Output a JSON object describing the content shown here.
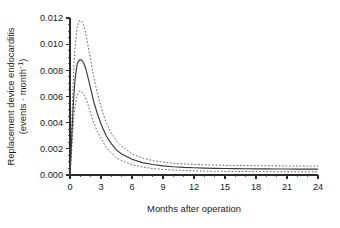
{
  "chart_data": {
    "type": "line",
    "title": "",
    "xlabel": "Months after operation",
    "ylabel_line1": "Replacement device endocarditis",
    "ylabel_line2_pre": "(events · month",
    "ylabel_line2_sup": "−1",
    "ylabel_line2_post": ")",
    "xlim": [
      0,
      24
    ],
    "ylim": [
      0,
      0.012
    ],
    "xticks": [
      0,
      3,
      6,
      9,
      12,
      15,
      18,
      21,
      24
    ],
    "xtick_labels": [
      "0",
      "3",
      "6",
      "9",
      "12",
      "15",
      "18",
      "21",
      "24"
    ],
    "x_minor_step": 1,
    "yticks": [
      0.0,
      0.002,
      0.004,
      0.006,
      0.008,
      0.01,
      0.012
    ],
    "ytick_labels": [
      "0.000",
      "0.002",
      "0.004",
      "0.006",
      "0.008",
      "0.010",
      "0.012"
    ],
    "y_minor_step": 0.0005,
    "grid": false,
    "legend": "none",
    "x": [
      0,
      0.1,
      0.2,
      0.3,
      0.4,
      0.5,
      0.7,
      0.9,
      1.1,
      1.3,
      1.5,
      1.7,
      2.0,
      2.3,
      2.6,
      3.0,
      3.5,
      4.0,
      4.5,
      5.0,
      6.0,
      7.0,
      8.0,
      9.0,
      10.0,
      11.0,
      12.0,
      13.0,
      14.0,
      15.0,
      16.0,
      17.0,
      18.0,
      19.0,
      20.0,
      21.0,
      22.0,
      23.0,
      24.0
    ],
    "series": [
      {
        "name": "Upper 95% confidence limit",
        "style": "dashed",
        "values": [
          0.0,
          0.0022,
          0.0046,
          0.0068,
          0.0086,
          0.0099,
          0.0113,
          0.0118,
          0.0118,
          0.0115,
          0.0109,
          0.0101,
          0.0088,
          0.0075,
          0.0064,
          0.0052,
          0.004,
          0.0032,
          0.0026,
          0.0022,
          0.0016,
          0.0013,
          0.0011,
          0.00098,
          0.0009,
          0.00085,
          0.00081,
          0.00078,
          0.00076,
          0.00074,
          0.00073,
          0.00072,
          0.00071,
          0.0007,
          0.0007,
          0.00069,
          0.00069,
          0.00068,
          0.00068
        ]
      },
      {
        "name": "Estimated hazard",
        "style": "solid",
        "values": [
          0.0,
          0.0016,
          0.0034,
          0.0051,
          0.0064,
          0.0074,
          0.0085,
          0.0088,
          0.0088,
          0.0086,
          0.0082,
          0.0076,
          0.0066,
          0.0056,
          0.0048,
          0.0039,
          0.003,
          0.0024,
          0.0019,
          0.0016,
          0.0012,
          0.00095,
          0.0008,
          0.0007,
          0.00063,
          0.00058,
          0.00055,
          0.00053,
          0.00051,
          0.0005,
          0.00049,
          0.00048,
          0.00047,
          0.00047,
          0.00046,
          0.00046,
          0.00045,
          0.00045,
          0.00045
        ]
      },
      {
        "name": "Lower 95% confidence limit",
        "style": "dashed",
        "values": [
          0.0,
          0.0011,
          0.0024,
          0.0036,
          0.0046,
          0.0053,
          0.0061,
          0.0064,
          0.0064,
          0.0062,
          0.0059,
          0.0055,
          0.0047,
          0.004,
          0.0034,
          0.0028,
          0.0021,
          0.0017,
          0.0013,
          0.0011,
          0.00078,
          0.00061,
          0.0005,
          0.00043,
          0.00038,
          0.00035,
          0.00032,
          0.0003,
          0.00029,
          0.00028,
          0.00027,
          0.00027,
          0.00026,
          0.00026,
          0.00025,
          0.00025,
          0.00025,
          0.00024,
          0.00024
        ]
      }
    ]
  }
}
